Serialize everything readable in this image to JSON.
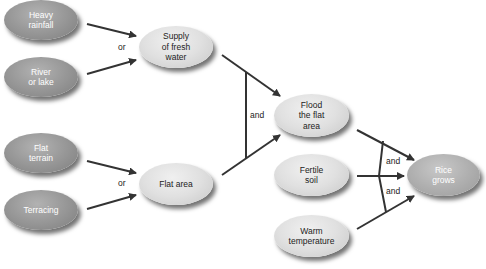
{
  "diagram": {
    "title": "",
    "nodes": {
      "heavy_rainfall": "Heavy\nrainfall",
      "river_lake": "River\nor lake",
      "flat_terrain": "Flat\nterrain",
      "terracing": "Terracing",
      "supply_fresh_water": "Supply\nof fresh\nwater",
      "flat_area": "Flat area",
      "flood_flat_area": "Flood\nthe flat\narea",
      "fertile_soil": "Fertile\nsoil",
      "warm_temperature": "Warm\ntemperature",
      "rice_grows": "Rice\ngrows"
    },
    "connectors": {
      "or_water": "or",
      "or_flat": "or",
      "and_flood": "and",
      "and_rice_upper": "and",
      "and_rice_lower": "and"
    },
    "edges": [
      {
        "from": "Heavy rainfall",
        "to": "Supply of fresh water",
        "logic": "or"
      },
      {
        "from": "River or lake",
        "to": "Supply of fresh water",
        "logic": "or"
      },
      {
        "from": "Flat terrain",
        "to": "Flat area",
        "logic": "or"
      },
      {
        "from": "Terracing",
        "to": "Flat area",
        "logic": "or"
      },
      {
        "from": "Supply of fresh water",
        "to": "Flood the flat area",
        "logic": "and"
      },
      {
        "from": "Flat area",
        "to": "Flood the flat area",
        "logic": "and"
      },
      {
        "from": "Flood the flat area",
        "to": "Rice grows",
        "logic": "and"
      },
      {
        "from": "Fertile soil",
        "to": "Rice grows",
        "logic": "and"
      },
      {
        "from": "Warm temperature",
        "to": "Rice grows",
        "logic": "and"
      }
    ],
    "colors": {
      "source_node": "#9a9a9a",
      "intermediate_node": "#e0e0e0",
      "arrow": "#333333"
    }
  }
}
